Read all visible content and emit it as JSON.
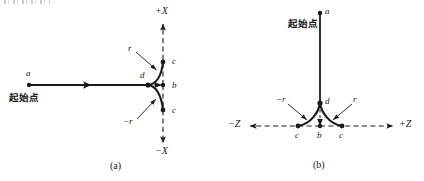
{
  "figure": {
    "panels": [
      {
        "id": "panel-a",
        "caption": "(a)",
        "axis_positive_label": "+X",
        "axis_negative_label": "−X",
        "start_point_label": "起始点",
        "start_node_label": "a",
        "branch_node_label": "d",
        "center_node_label": "b",
        "upper_end_label": "c",
        "lower_end_label": "c",
        "radius_label_positive": "r",
        "radius_label_negative": "−r"
      },
      {
        "id": "panel-b",
        "caption": "(b)",
        "axis_positive_label": "+Z",
        "axis_negative_label": "−Z",
        "start_point_label": "起始点",
        "start_node_label": "a",
        "branch_node_label": "d",
        "center_node_label": "b",
        "left_end_label": "c",
        "right_end_label": "c",
        "radius_label_positive": "r",
        "radius_label_negative": "−r"
      }
    ],
    "colors": {
      "ink": "#1a1a1a",
      "background": "#ffffff"
    }
  }
}
